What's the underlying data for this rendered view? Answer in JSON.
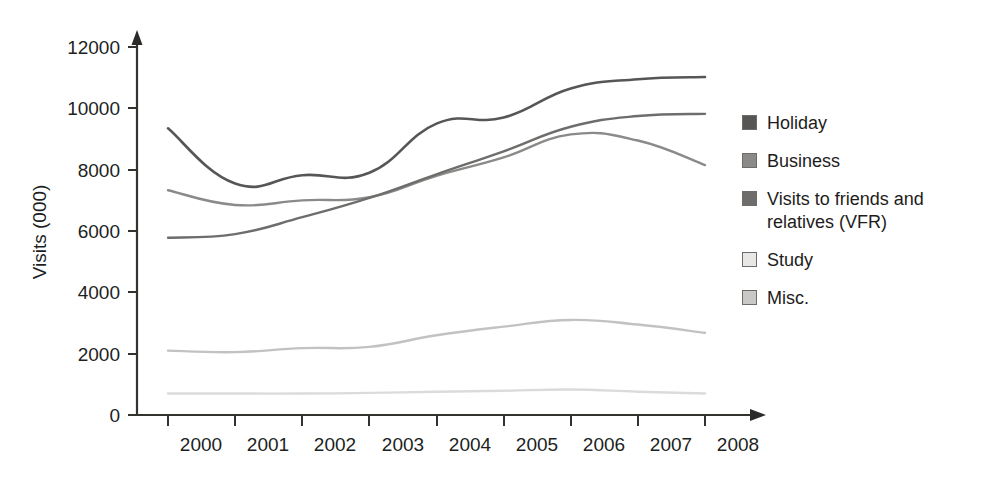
{
  "chart_data": {
    "type": "line",
    "title": "",
    "xlabel": "",
    "ylabel": "Visits (000)",
    "x": [
      2000,
      2001,
      2002,
      2003,
      2004,
      2005,
      2006,
      2007,
      2008
    ],
    "xtick_labels": [
      "2000",
      "2001",
      "2002",
      "2003",
      "2004",
      "2005",
      "2006",
      "2007",
      "2008"
    ],
    "ytick_labels": [
      "0",
      "2000",
      "4000",
      "6000",
      "8000",
      "10000",
      "12000"
    ],
    "yticks": [
      0,
      2000,
      4000,
      6000,
      8000,
      10000,
      12000
    ],
    "ylim": [
      0,
      12000
    ],
    "xlim": [
      2000,
      2008
    ],
    "grid": false,
    "legend_position": "right",
    "series": [
      {
        "name": "Holiday",
        "color": "#575654",
        "values": [
          9350,
          7550,
          7820,
          7900,
          9500,
          9700,
          10650,
          10950,
          11020
        ]
      },
      {
        "name": "Business",
        "color": "#8b8a88",
        "values": [
          7330,
          6850,
          7000,
          7100,
          7800,
          8400,
          9150,
          8950,
          8150
        ]
      },
      {
        "name": "Visits to friends and relatives (VFR)",
        "color": "#6e6d6b",
        "values": [
          5780,
          5900,
          6450,
          7080,
          7850,
          8600,
          9400,
          9750,
          9820
        ]
      },
      {
        "name": "Study",
        "color": "#c3c2c0",
        "values": [
          2100,
          2050,
          2180,
          2220,
          2600,
          2880,
          3100,
          2950,
          2680
        ]
      },
      {
        "name": "Misc.",
        "color": "#dcdbd9",
        "values": [
          700,
          700,
          700,
          720,
          760,
          790,
          830,
          760,
          700
        ]
      }
    ]
  },
  "axes": {
    "y_axis_title": "Visits (000)",
    "y_tick_labels": [
      "12000",
      "10000",
      "8000",
      "6000",
      "4000",
      "2000",
      "0"
    ],
    "x_tick_labels": [
      "2000",
      "2001",
      "2002",
      "2003",
      "2004",
      "2005",
      "2006",
      "2007",
      "2008"
    ]
  },
  "legend": {
    "items": [
      {
        "label": "Holiday",
        "color": "#575654"
      },
      {
        "label": "Business",
        "color": "#8b8a88"
      },
      {
        "label": "Visits to friends and\nrelatives (VFR)",
        "color": "#6e6d6b"
      },
      {
        "label": "Study",
        "color": "#e8e7e5"
      },
      {
        "label": "Misc.",
        "color": "#c9c8c6"
      }
    ]
  }
}
